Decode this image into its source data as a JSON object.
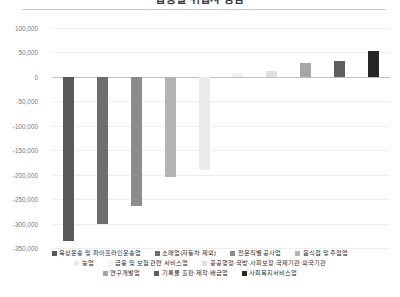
{
  "chart_data": {
    "type": "bar",
    "title": "업종별 취업자 증감",
    "xlabel": "",
    "ylabel": "",
    "ylim": [
      -350000,
      100000
    ],
    "ytick_step": 50000,
    "ytick_labels": [
      "100,000",
      "50,000",
      "0",
      "-50,000",
      "-100,000",
      "-150,000",
      "-200,000",
      "-250,000",
      "-300,000",
      "-350,000"
    ],
    "ytick_values": [
      100000,
      50000,
      0,
      -50000,
      -100000,
      -150000,
      -200000,
      -250000,
      -300000,
      -350000
    ],
    "grid": true,
    "legend_position": "bottom",
    "categories": [
      "육상운송 및 파이프라인운송업",
      "소매업(자동차 제외)",
      "전문직별 공사업",
      "음식점 및 주점업",
      "농업",
      "금융 및 보험 관련 서비스업",
      "공공행정·국방·사회보장·국제기관·외국기관",
      "연구개발업",
      "기록물 출판·제작·배급업",
      "사회복지서비스업"
    ],
    "values": [
      -335000,
      -300000,
      -265000,
      -205000,
      -190000,
      8000,
      12000,
      28000,
      33000,
      52000
    ],
    "colors": [
      "#595959",
      "#6e6e6e",
      "#8c8c8c",
      "#b4b4b4",
      "#ebebeb",
      "#f2f2f2",
      "#e0e0e0",
      "#a6a6a6",
      "#5e5e5e",
      "#262626"
    ]
  },
  "legend_rows": [
    [
      0,
      1,
      2,
      3
    ],
    [
      4,
      5,
      6
    ],
    [
      7,
      8,
      9
    ]
  ]
}
